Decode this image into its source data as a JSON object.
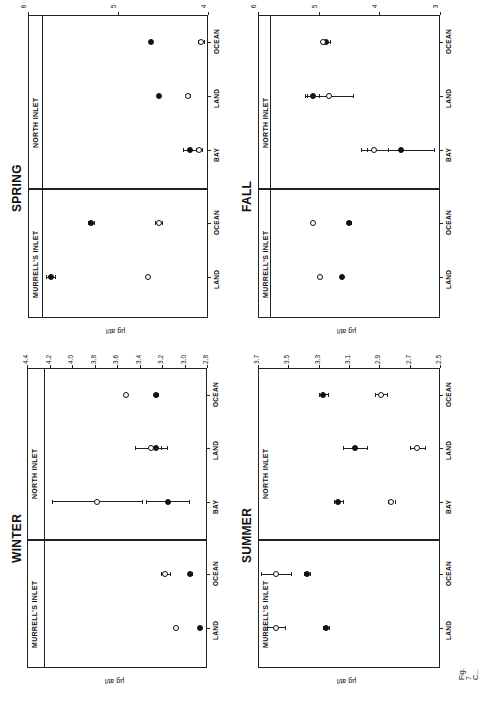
{
  "figure": {
    "orientation": "rotated 90 degrees (landscape page)",
    "caption_fragment": "Fig. 7  C..."
  },
  "labels": {
    "murrells_inlet": "MURRELL'S INLET",
    "north_inlet": "NORTH INLET",
    "y_unit": "µg at/l"
  },
  "chart_data": [
    {
      "type": "scatter",
      "title": "SPRING",
      "ylabel": "µg at/l",
      "ylim": [
        4,
        6
      ],
      "yticks": [
        "6",
        "5",
        "4"
      ],
      "reference_line": 5.85,
      "categories": [
        "MURRELL'S INLET LAND",
        "MURRELL'S INLET OCEAN",
        "NORTH INLET BAY",
        "NORTH INLET LAND",
        "NORTH INLET OCEAN"
      ],
      "xtick_labels": [
        "LAND",
        "OCEAN",
        "BAY",
        "LAND",
        "OCEAN"
      ],
      "series": [
        {
          "name": "filled",
          "values": [
            5.75,
            5.3,
            4.2,
            4.55,
            4.63
          ],
          "err": [
            0.05,
            0.03,
            0.08,
            0.02,
            0.01
          ]
        },
        {
          "name": "open",
          "values": [
            4.67,
            4.55,
            4.1,
            4.22,
            4.08
          ],
          "err": [
            0.0,
            0.04,
            0.03,
            0.02,
            0.03
          ]
        }
      ]
    },
    {
      "type": "scatter",
      "title": "FALL",
      "ylabel": "µg at/l",
      "ylim": [
        3,
        6
      ],
      "yticks": [
        "6",
        "5",
        "4",
        "3"
      ],
      "reference_line": 5.8,
      "categories": [
        "MURRELL'S INLET LAND",
        "MURRELL'S INLET OCEAN",
        "NORTH INLET BAY",
        "NORTH INLET LAND",
        "NORTH INLET OCEAN"
      ],
      "xtick_labels": [
        "LAND",
        "OCEAN",
        "BAY",
        "LAND",
        "OCEAN"
      ],
      "series": [
        {
          "name": "filled",
          "values": [
            4.62,
            4.5,
            3.65,
            5.1,
            4.88
          ],
          "err": [
            0.0,
            0.03,
            0.55,
            0.1,
            0.06
          ]
        },
        {
          "name": "open",
          "values": [
            4.98,
            5.1,
            4.08,
            4.83,
            4.93
          ],
          "err": [
            0.02,
            0.0,
            0.22,
            0.4,
            0.03
          ]
        }
      ]
    },
    {
      "type": "scatter",
      "title": "WINTER",
      "ylabel": "µg at/l",
      "ylim": [
        2.8,
        4.4
      ],
      "yticks": [
        "4.4",
        "4.2",
        "4.0",
        "3.8",
        "3.6",
        "3.4",
        "3.2",
        "3.0",
        "2.8"
      ],
      "reference_line": 4.25,
      "categories": [
        "MURRELL'S INLET LAND",
        "MURRELL'S INLET OCEAN",
        "NORTH INLET BAY",
        "NORTH INLET LAND",
        "NORTH INLET OCEAN"
      ],
      "xtick_labels": [
        "LAND",
        "OCEAN",
        "BAY",
        "LAND",
        "OCEAN"
      ],
      "series": [
        {
          "name": "filled",
          "values": [
            2.86,
            2.95,
            3.15,
            3.25,
            3.25
          ],
          "err": [
            0.0,
            0.02,
            0.19,
            0.04,
            0.01
          ]
        },
        {
          "name": "open",
          "values": [
            3.08,
            3.17,
            3.78,
            3.3,
            3.52
          ],
          "err": [
            0.0,
            0.04,
            0.4,
            0.14,
            0.01
          ]
        }
      ]
    },
    {
      "type": "scatter",
      "title": "SUMMER",
      "ylabel": "µg at/l",
      "ylim": [
        2.5,
        3.7
      ],
      "yticks": [
        "3.7",
        "3.5",
        "3.3",
        "3.1",
        "2.9",
        "2.7",
        "2.5"
      ],
      "reference_line": 3.7,
      "categories": [
        "MURRELL'S INLET LAND",
        "MURRELL'S INLET OCEAN",
        "NORTH INLET BAY",
        "NORTH INLET LAND",
        "NORTH INLET OCEAN"
      ],
      "xtick_labels": [
        "LAND",
        "OCEAN",
        "BAY",
        "LAND",
        "OCEAN"
      ],
      "series": [
        {
          "name": "filled",
          "values": [
            3.25,
            3.38,
            3.17,
            3.06,
            3.27
          ],
          "err": [
            0.02,
            0.02,
            0.03,
            0.08,
            0.03
          ]
        },
        {
          "name": "open",
          "values": [
            3.58,
            3.58,
            2.82,
            2.65,
            2.89
          ],
          "err": [
            0.06,
            0.1,
            0.02,
            0.05,
            0.04
          ]
        }
      ]
    }
  ]
}
